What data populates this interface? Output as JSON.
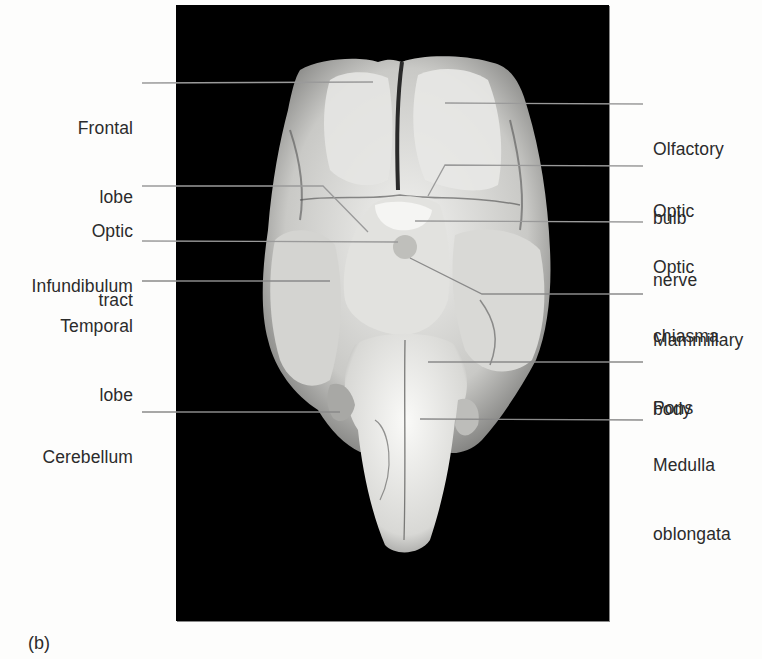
{
  "figure": {
    "panel_letter": "(b)",
    "colors": {
      "photo_background": "#000000",
      "page_background": "#fdfdfc",
      "label_text": "#2b2b2b",
      "leader_line_on_dark": "#bdbdbd",
      "leader_line_on_light": "#3a3a3a"
    }
  },
  "labels": {
    "left": [
      {
        "id": "frontal_lobe",
        "line1": "Frontal",
        "line2": "lobe",
        "top": 71
      },
      {
        "id": "optic_tract",
        "line1": "Optic",
        "line2": "tract",
        "top": 174
      },
      {
        "id": "infundibulum",
        "line1": "Infundibulum",
        "line2": "",
        "top": 229
      },
      {
        "id": "temporal_lobe",
        "line1": "Temporal",
        "line2": "lobe",
        "top": 269
      },
      {
        "id": "cerebellum",
        "line1": "Cerebellum",
        "line2": "",
        "top": 400
      }
    ],
    "right": [
      {
        "id": "olfactory_bulb",
        "line1": "Olfactory",
        "line2": "bulb",
        "top": 92
      },
      {
        "id": "optic_nerve",
        "line1": "Optic",
        "line2": "nerve",
        "top": 154
      },
      {
        "id": "optic_chiasma",
        "line1": "Optic",
        "line2": "chiasma",
        "top": 210
      },
      {
        "id": "mammillary_body",
        "line1": "Mammillary",
        "line2": "body",
        "top": 283
      },
      {
        "id": "pons",
        "line1": "Pons",
        "line2": "",
        "top": 351
      },
      {
        "id": "medulla_oblongata",
        "line1": "Medulla",
        "line2": "oblongata",
        "top": 408
      }
    ]
  }
}
